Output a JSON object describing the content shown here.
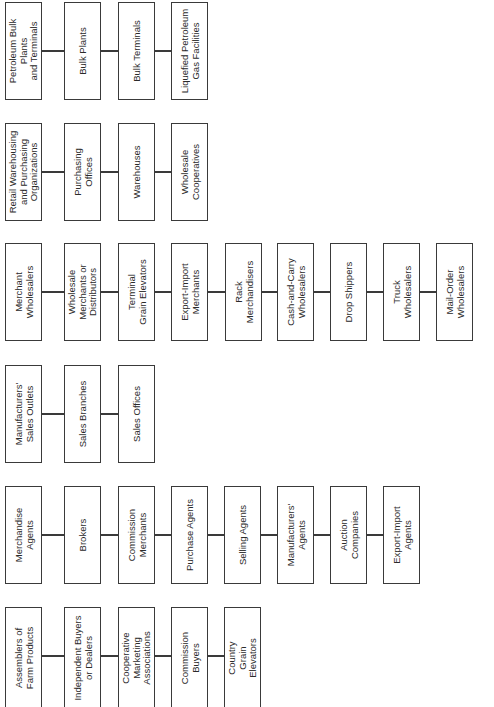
{
  "diagram": {
    "orientation": "rotated-90-ccw",
    "colors": {
      "background": "#ffffff",
      "border": "#3a3a3a",
      "text": "#2a2a2a"
    },
    "groups": [
      {
        "header": "Petroleum Bulk\nPlants\nand Terminals",
        "items": [
          "Bulk Plants",
          "Bulk Terminals",
          "Liquefied Petroleum\nGas Facilities"
        ]
      },
      {
        "header": "Retail Warehousing\nand Purchasing\nOrganizations",
        "items": [
          "Purchasing\nOffices",
          "Warehouses",
          "Wholesale\nCooperatives"
        ]
      },
      {
        "header": "Merchant\nWholesalers",
        "items": [
          "Wholesale\nMerchants or\nDistributors",
          "Terminal\nGrain Elevators",
          "Export-Import\nMerchants",
          "Rack\nMerchandisers",
          "Cash-and-Carry\nWholesalers",
          "Drop Shippers",
          "Truck\nWholesalers",
          "Mail-Order\nWholesalers"
        ]
      },
      {
        "header": "Manufacturers'\nSales Outlets",
        "items": [
          "Sales Branches",
          "Sales Offices"
        ]
      },
      {
        "header": "Merchandise\nAgents",
        "items": [
          "Brokers",
          "Commission\nMerchants",
          "Purchase Agents",
          "Selling Agents",
          "Manufacturers'\nAgents",
          "Auction\nCompanies",
          "Export-Import\nAgents"
        ]
      },
      {
        "header": "Assemblers of\nFarm Products",
        "items": [
          "Independent Buyers\nor Dealers",
          "Cooperative\nMarketing\nAssociations",
          "Commission\nBuyers",
          "Country\nGrain\nElevators"
        ]
      }
    ]
  }
}
